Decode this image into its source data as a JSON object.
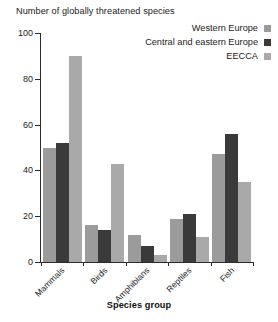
{
  "chart_data": {
    "type": "bar",
    "title": "Number of globally threatened species",
    "xlabel": "Species group",
    "ylabel": "",
    "categories": [
      "Mammals",
      "Birds",
      "Amphibians",
      "Reptiles",
      "Fish"
    ],
    "series": [
      {
        "name": "Western Europe",
        "color": "#9b9b9b",
        "values": [
          50,
          16,
          12,
          19,
          47
        ]
      },
      {
        "name": "Central and eastern Europe",
        "color": "#3a3a3a",
        "values": [
          52,
          14,
          7,
          21,
          56
        ]
      },
      {
        "name": "EECCA",
        "color": "#a9a9a9",
        "values": [
          90,
          43,
          3,
          11,
          35
        ]
      }
    ],
    "ylim": [
      0,
      100
    ],
    "yticks": [
      0,
      20,
      40,
      60,
      80,
      100
    ],
    "ytick_labels": [
      "0",
      "20",
      "40",
      "60",
      "80",
      "100"
    ],
    "grid": false,
    "legend_position": "top-right"
  },
  "legend": {
    "items": [
      {
        "label": "Western Europe",
        "swatch": "#9b9b9b"
      },
      {
        "label": "Central and eastern Europe",
        "swatch": "#3a3a3a"
      },
      {
        "label": "EECCA",
        "swatch": "#a9a9a9"
      }
    ]
  }
}
